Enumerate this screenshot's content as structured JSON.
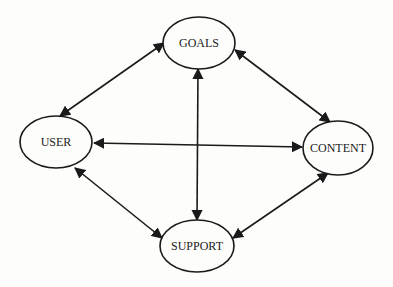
{
  "diagram": {
    "type": "bidirectional-relationship-graph",
    "nodes": [
      {
        "id": "goals",
        "label": "GOALS",
        "cx": 199,
        "cy": 43,
        "rx": 36,
        "ry": 26
      },
      {
        "id": "user",
        "label": "USER",
        "cx": 56,
        "cy": 142,
        "rx": 36,
        "ry": 26
      },
      {
        "id": "content",
        "label": "CONTENT",
        "cx": 338,
        "cy": 148,
        "rx": 35,
        "ry": 27
      },
      {
        "id": "support",
        "label": "SUPPORT",
        "cx": 197,
        "cy": 246,
        "rx": 37,
        "ry": 26
      }
    ],
    "edges": [
      {
        "from": "user",
        "to": "goals",
        "x1": 60,
        "y1": 116,
        "x2": 164,
        "y2": 43,
        "direction": "both"
      },
      {
        "from": "goals",
        "to": "content",
        "x1": 235,
        "y1": 50,
        "x2": 330,
        "y2": 122,
        "direction": "both"
      },
      {
        "from": "user",
        "to": "content",
        "x1": 94,
        "y1": 143,
        "x2": 302,
        "y2": 147,
        "direction": "both"
      },
      {
        "from": "goals",
        "to": "support",
        "x1": 198,
        "y1": 69,
        "x2": 197,
        "y2": 220,
        "direction": "both"
      },
      {
        "from": "user",
        "to": "support",
        "x1": 75,
        "y1": 168,
        "x2": 162,
        "y2": 238,
        "direction": "both"
      },
      {
        "from": "support",
        "to": "content",
        "x1": 233,
        "y1": 238,
        "x2": 328,
        "y2": 173,
        "direction": "both"
      }
    ]
  }
}
